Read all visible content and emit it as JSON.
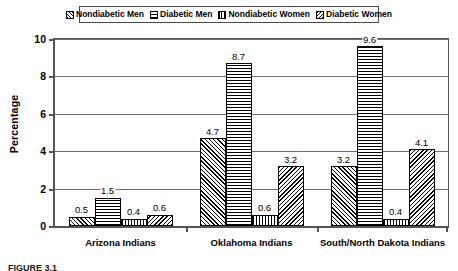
{
  "chart_data": {
    "type": "bar",
    "title": "",
    "xlabel": "",
    "ylabel": "Percentage",
    "ylim": [
      0,
      10
    ],
    "yticks": [
      0,
      2,
      4,
      6,
      8,
      10
    ],
    "ytick_labels": [
      "0",
      "2",
      "4",
      "6",
      "8",
      "10"
    ],
    "grid": "horizontal",
    "legend_position": "top-center",
    "categories": [
      "Arizona Indians",
      "Oklahoma Indians",
      "South/North Dakota Indians"
    ],
    "series": [
      {
        "name": "Nondiabetic Men",
        "pattern": "forward-diagonal",
        "values": [
          0.5,
          4.7,
          3.2
        ],
        "labels": [
          "0.5",
          "4.7",
          "3.2"
        ]
      },
      {
        "name": "Diabetic Men",
        "pattern": "horizontal-lines",
        "values": [
          1.5,
          8.7,
          9.6
        ],
        "labels": [
          "1.5",
          "8.7",
          "9.6"
        ]
      },
      {
        "name": "Nondiabetic Women",
        "pattern": "vertical-lines",
        "values": [
          0.4,
          0.6,
          0.4
        ],
        "labels": [
          "0.4",
          "0.6",
          "0.4"
        ]
      },
      {
        "name": "Diabetic Women",
        "pattern": "backward-diagonal",
        "values": [
          0.6,
          3.2,
          4.1
        ],
        "labels": [
          "0.6",
          "3.2",
          "4.1"
        ]
      }
    ]
  },
  "legend": {
    "items": [
      {
        "label": "Nondiabetic Men",
        "swatch": "forward-diagonal-swatch"
      },
      {
        "label": "Diabetic Men",
        "swatch": "horizontal-lines-swatch"
      },
      {
        "label": "Nondiabetic Women",
        "swatch": "vertical-lines-swatch"
      },
      {
        "label": "Diabetic Women",
        "swatch": "backward-diagonal-swatch"
      }
    ]
  },
  "caption": {
    "text": "FIGURE 3.1"
  },
  "colors": {
    "axis": "#555555",
    "grid": "#6e6e6e",
    "bar_outline": "#000000",
    "background": "#ffffff"
  }
}
